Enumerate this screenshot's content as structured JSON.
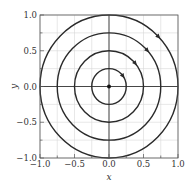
{
  "chart_data": {
    "type": "line",
    "title": "",
    "xlabel": "x",
    "ylabel": "y",
    "xlim": [
      -1.0,
      1.0
    ],
    "ylim": [
      -1.0,
      1.0
    ],
    "grid": true,
    "x_ticks": [
      "-1.0",
      "-0.5",
      "0.0",
      "0.5",
      "1.0"
    ],
    "y_ticks": [
      "-1.0",
      "-0.5",
      "0.0",
      "0.5",
      "1.0"
    ],
    "minor_grid_step": 0.25,
    "series": [
      {
        "name": "circle r=0.25",
        "radius": 0.25,
        "arrow_angle_deg": 35
      },
      {
        "name": "circle r=0.5",
        "radius": 0.5,
        "arrow_angle_deg": 40
      },
      {
        "name": "circle r=0.75",
        "radius": 0.75,
        "arrow_angle_deg": 42
      },
      {
        "name": "circle r=1.0",
        "radius": 1.0,
        "arrow_angle_deg": 44
      }
    ],
    "center_point": {
      "x": 0.0,
      "y": 0.0
    },
    "direction": "clockwise",
    "line_color": "#2a2a2a",
    "grid_color": "#d9d9d9"
  }
}
